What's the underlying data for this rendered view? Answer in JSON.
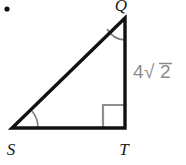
{
  "figure": {
    "type": "right-triangle-diagram",
    "bullet": {
      "name": "list-bullet",
      "cx": 7,
      "cy": 9,
      "r": 2.6,
      "color": "#111111"
    },
    "colors": {
      "stroke": "#111111",
      "background": "#ffffff",
      "label_text": "#1a1a1a",
      "side_label_text": "#8a8a8a",
      "angle_arc": "#7d7d7d",
      "right_angle_mark": "#8f8f8f"
    },
    "vertices": [
      {
        "id": "Q",
        "label": "Q",
        "x": 125,
        "y": 18,
        "label_x": 121,
        "label_y": 11
      },
      {
        "id": "S",
        "label": "S",
        "x": 12,
        "y": 128,
        "label_x": 11,
        "label_y": 155
      },
      {
        "id": "T",
        "label": "T",
        "x": 125,
        "y": 128,
        "label_x": 124,
        "label_y": 155
      }
    ],
    "sides": [
      {
        "id": "QT",
        "from": "Q",
        "to": "T",
        "label": "4√2",
        "label_coefficient": "4",
        "label_radical": "√",
        "label_radicand": "2",
        "label_x": 133,
        "label_y": 78
      },
      {
        "id": "ST",
        "from": "S",
        "to": "T",
        "label": ""
      },
      {
        "id": "SQ",
        "from": "S",
        "to": "Q",
        "label": ""
      }
    ],
    "angle_marks": [
      {
        "id": "angle-Q",
        "at": "Q",
        "kind": "arc",
        "radius": 22
      },
      {
        "id": "angle-S",
        "at": "S",
        "kind": "arc",
        "radius": 26
      },
      {
        "id": "angle-T",
        "at": "T",
        "kind": "right-angle-square",
        "size": 22
      }
    ]
  }
}
